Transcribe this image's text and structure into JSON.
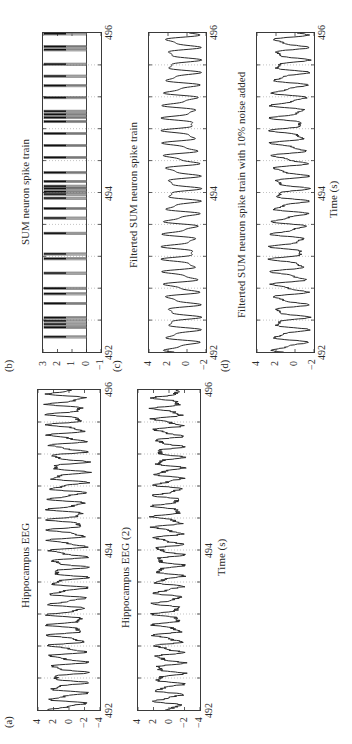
{
  "figure": {
    "rotation_deg": -90,
    "time_axis": {
      "min": 492,
      "max": 496,
      "mid": 494,
      "label": "Time (s)",
      "grid_step_s": 0.4
    }
  },
  "panels": {
    "b": {
      "letter": "(b)",
      "title": "SUM neuron spike train",
      "yticks": [
        "3",
        "2",
        "1",
        "0",
        "−1"
      ],
      "ylim": [
        -1,
        3
      ],
      "xtick_start": "492",
      "xtick_mid": "494",
      "xtick_end": "496"
    },
    "c": {
      "letter": "(c)",
      "title": "Filterted SUM neuron spike train",
      "yticks": [
        "4",
        "2",
        "0",
        "−2"
      ],
      "ylim": [
        -2,
        4
      ],
      "xtick_start": "492",
      "xtick_mid": "494",
      "xtick_end": "496"
    },
    "d": {
      "letter": "(d)",
      "title": "Filterted SUM neuron spike train with 10% noise added",
      "yticks": [
        "4",
        "2",
        "0",
        "−2"
      ],
      "ylim": [
        -2,
        4
      ],
      "xtick_start": "492",
      "xtick_mid": "494",
      "xtick_end": "496",
      "xlabel": "Time (s)"
    },
    "a": {
      "letter": "(a)",
      "title": "Hippocampus EEG",
      "yticks": [
        "4",
        "2",
        "0",
        "−2",
        "−4"
      ],
      "ylim": [
        -4,
        4
      ],
      "xtick_start": "492",
      "xtick_mid": "494",
      "xtick_end": "496"
    },
    "a2": {
      "letter": "",
      "title": "Hippocampus EEG (2)",
      "yticks": [
        "4",
        "2",
        "0",
        "−2",
        "−4"
      ],
      "ylim": [
        -4,
        4
      ],
      "xtick_start": "492",
      "xtick_mid": "494",
      "xtick_end": "496",
      "xlabel": "Time (s)"
    }
  },
  "chart_data": [
    {
      "type": "line",
      "title": "SUM neuron spike train",
      "panel": "(b)",
      "xlabel": "",
      "ylabel": "",
      "xlim": [
        492,
        496
      ],
      "ylim": [
        -1,
        3
      ],
      "xticks": [
        492,
        494,
        496
      ],
      "yticks": [
        -1,
        0,
        1,
        2,
        3
      ],
      "grid": true,
      "spike_times_s": [
        492.19,
        492.31,
        492.35,
        492.39,
        492.43,
        492.61,
        492.73,
        492.8,
        492.99,
        493.17,
        493.23,
        493.49,
        493.68,
        493.8,
        493.93,
        493.98,
        494.01,
        494.05,
        494.08,
        494.14,
        494.25,
        494.44,
        494.59,
        494.74,
        494.89,
        494.94,
        494.98,
        495.02,
        495.19,
        495.34,
        495.46,
        495.61,
        495.79,
        495.83,
        495.99
      ],
      "spike_amplitude": [
        0,
        3
      ]
    },
    {
      "type": "line",
      "title": "Filterted SUM neuron spike train",
      "panel": "(c)",
      "xlim": [
        492,
        496
      ],
      "ylim": [
        -2,
        4
      ],
      "xticks": [
        492,
        494,
        496
      ],
      "yticks": [
        -2,
        0,
        2,
        4
      ],
      "grid": true,
      "description": "smooth oscillation ~6-7 Hz, peaks ~2-3, troughs ~-1.5",
      "x": [
        492.0,
        492.2,
        492.4,
        492.6,
        492.8,
        493.0,
        493.2,
        493.4,
        493.6,
        493.8,
        494.0,
        494.2,
        494.4,
        494.6,
        494.8,
        495.0,
        495.2,
        495.4,
        495.6,
        495.8,
        496.0
      ],
      "y": [
        0.0,
        1.6,
        3.0,
        1.0,
        2.5,
        -1.2,
        2.2,
        -1.3,
        1.8,
        -1.0,
        2.5,
        -1.3,
        2.0,
        -1.0,
        1.5,
        -1.2,
        2.3,
        -1.4,
        2.4,
        -1.3,
        1.6
      ]
    },
    {
      "type": "line",
      "title": "Filterted SUM neuron spike train with 10% noise added",
      "panel": "(d)",
      "xlim": [
        492,
        496
      ],
      "ylim": [
        -2,
        4
      ],
      "xticks": [
        492,
        494,
        496
      ],
      "yticks": [
        -2,
        0,
        2,
        4
      ],
      "xlabel": "Time (s)",
      "grid": true,
      "x": [
        492.0,
        492.2,
        492.4,
        492.6,
        492.8,
        493.0,
        493.2,
        493.4,
        493.6,
        493.8,
        494.0,
        494.2,
        494.4,
        494.6,
        494.8,
        495.0,
        495.2,
        495.4,
        495.6,
        495.8,
        496.0
      ],
      "y": [
        0.1,
        1.7,
        3.0,
        1.1,
        2.4,
        -1.1,
        2.3,
        -1.2,
        1.9,
        -0.9,
        2.4,
        -1.2,
        2.1,
        -1.1,
        1.6,
        -1.1,
        2.2,
        -1.3,
        2.6,
        -1.2,
        1.5
      ]
    },
    {
      "type": "line",
      "title": "Hippocampus EEG",
      "panel": "(a)",
      "xlim": [
        492,
        496
      ],
      "ylim": [
        -4,
        4
      ],
      "xticks": [
        492,
        494,
        496
      ],
      "yticks": [
        -4,
        -2,
        0,
        2,
        4
      ],
      "grid": true,
      "description": "theta oscillation ~7-8 Hz, amplitude ~±2.5",
      "x": [
        492.0,
        492.1,
        492.2,
        492.3,
        492.4,
        492.5,
        492.6,
        492.7,
        492.8,
        492.9,
        493.0,
        493.1,
        493.2,
        493.3,
        493.4,
        493.5,
        493.6,
        493.7,
        493.8,
        493.9,
        494.0
      ],
      "y": [
        0.5,
        -2.0,
        2.5,
        -2.2,
        2.8,
        -2.0,
        2.6,
        -2.3,
        2.7,
        -2.1,
        2.4,
        -2.2,
        2.5,
        -2.0,
        2.6,
        -2.4,
        2.8,
        -2.1,
        2.5,
        -2.3,
        2.4
      ]
    },
    {
      "type": "line",
      "title": "Hippocampus EEG (2)",
      "xlim": [
        492,
        496
      ],
      "ylim": [
        -4,
        4
      ],
      "xticks": [
        492,
        494,
        496
      ],
      "yticks": [
        -4,
        -2,
        0,
        2,
        4
      ],
      "xlabel": "Time (s)",
      "grid": true,
      "description": "theta oscillation, amplitude ~±2, noisier",
      "x": [
        492.0,
        492.1,
        492.2,
        492.3,
        492.4,
        492.5,
        492.6,
        492.7,
        492.8,
        492.9,
        493.0,
        493.1,
        493.2,
        493.3,
        493.4,
        493.5,
        493.6,
        493.7,
        493.8,
        493.9,
        494.0
      ],
      "y": [
        1.8,
        -1.5,
        2.0,
        -2.0,
        1.8,
        -1.8,
        2.2,
        -1.6,
        1.9,
        -2.0,
        2.0,
        -1.7,
        1.8,
        -1.9,
        2.1,
        -1.5,
        1.7,
        -2.0,
        2.0,
        -1.6,
        1.9
      ]
    }
  ]
}
